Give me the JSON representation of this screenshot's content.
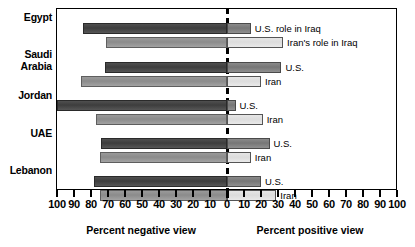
{
  "chart_data": {
    "type": "bar",
    "orientation": "horizontal-diverging",
    "title": "",
    "xlabel_left": "Percent negative view",
    "xlabel_right": "Percent positive view",
    "ylabel": "",
    "xlim": [
      -100,
      100
    ],
    "xtick_labels": [
      "100",
      "90",
      "80",
      "70",
      "60",
      "50",
      "40",
      "30",
      "20",
      "10",
      "0",
      "10",
      "20",
      "30",
      "40",
      "50",
      "60",
      "70",
      "80",
      "90",
      "100"
    ],
    "xtick_values": [
      -100,
      -90,
      -80,
      -70,
      -60,
      -50,
      -40,
      -30,
      -20,
      -10,
      0,
      10,
      20,
      30,
      40,
      50,
      60,
      70,
      80,
      90,
      100
    ],
    "grid": false,
    "legend_position": "inline-right",
    "categories": [
      "Egypt",
      "Saudi Arabia",
      "Jordan",
      "UAE",
      "Lebanon"
    ],
    "series": [
      {
        "name": "U.S. role in Iraq",
        "short_name": "U.S.",
        "negative_values": [
          85,
          72,
          100,
          74,
          78
        ],
        "positive_values": [
          14,
          32,
          5,
          25,
          20
        ]
      },
      {
        "name": "Iran's role in Iraq",
        "short_name": "Iran",
        "negative_values": [
          71,
          86,
          77,
          75,
          75
        ],
        "positive_values": [
          33,
          20,
          21,
          14,
          29
        ]
      }
    ],
    "colors": {
      "us_negative": "#3d3d3d",
      "us_positive": "#767676",
      "iran_negative": "#8b8b8b",
      "iran_positive": "#dcdcdc",
      "axis": "#000000"
    }
  },
  "country_labels": [
    {
      "text": "Egypt",
      "top": 12
    },
    {
      "text": "Saudi\nArabia",
      "top": 49
    },
    {
      "text": "Jordan",
      "top": 90
    },
    {
      "text": "UAE",
      "top": 128
    },
    {
      "text": "Lebanon",
      "top": 165
    }
  ],
  "bars": [
    {
      "country": "Egypt",
      "series": "U.S. role in Iraq",
      "row": 0,
      "top": 14,
      "neg": 85,
      "pos": 14,
      "note": "U.S. role in Iraq"
    },
    {
      "country": "Egypt",
      "series": "Iran's role in Iraq",
      "row": 0,
      "top": 28,
      "neg": 71,
      "pos": 33,
      "note": "Iran's role in Iraq"
    },
    {
      "country": "Saudi Arabia",
      "series": "U.S. role in Iraq",
      "row": 1,
      "top": 53,
      "neg": 72,
      "pos": 32,
      "note": "U.S."
    },
    {
      "country": "Saudi Arabia",
      "series": "Iran's role in Iraq",
      "row": 1,
      "top": 67,
      "neg": 86,
      "pos": 20,
      "note": "Iran"
    },
    {
      "country": "Jordan",
      "series": "U.S. role in Iraq",
      "row": 2,
      "top": 91,
      "neg": 100,
      "pos": 5,
      "note": "U.S."
    },
    {
      "country": "Jordan",
      "series": "Iran's role in Iraq",
      "row": 2,
      "top": 105,
      "neg": 77,
      "pos": 21,
      "note": "Iran"
    },
    {
      "country": "UAE",
      "series": "U.S. role in Iraq",
      "row": 3,
      "top": 129,
      "neg": 74,
      "pos": 25,
      "note": "U.S."
    },
    {
      "country": "UAE",
      "series": "Iran's role in Iraq",
      "row": 3,
      "top": 143,
      "neg": 75,
      "pos": 14,
      "note": "Iran"
    },
    {
      "country": "Lebanon",
      "series": "U.S. role in Iraq",
      "row": 4,
      "top": 167,
      "neg": 78,
      "pos": 20,
      "note": "U.S."
    },
    {
      "country": "Lebanon",
      "series": "Iran's role in Iraq",
      "row": 4,
      "top": 181,
      "neg": 75,
      "pos": 29,
      "note": "Iran"
    }
  ]
}
